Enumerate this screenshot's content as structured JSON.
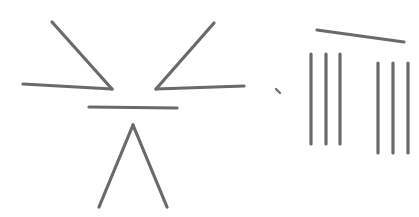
{
  "diagram": {
    "type": "matchstick-puzzle",
    "stick_color": "#6a6a6a",
    "stick_width": 3.2,
    "background": "#ffffff",
    "groups": [
      {
        "name": "figure-left",
        "sticks": [
          {
            "name": "left-upper-diagonal",
            "x1": 52,
            "y1": 22,
            "x2": 112,
            "y2": 89
          },
          {
            "name": "left-lower-arm",
            "x1": 23,
            "y1": 84,
            "x2": 112,
            "y2": 89
          },
          {
            "name": "right-upper-diagonal",
            "x1": 214,
            "y1": 23,
            "x2": 156,
            "y2": 89
          },
          {
            "name": "right-lower-arm",
            "x1": 156,
            "y1": 89,
            "x2": 244,
            "y2": 86
          },
          {
            "name": "middle-bar",
            "x1": 89,
            "y1": 107,
            "x2": 177,
            "y2": 108
          },
          {
            "name": "lambda-left-leg",
            "x1": 133,
            "y1": 125,
            "x2": 99,
            "y2": 207
          },
          {
            "name": "lambda-right-leg",
            "x1": 133,
            "y1": 125,
            "x2": 167,
            "y2": 207
          }
        ]
      },
      {
        "name": "figure-right",
        "sticks": [
          {
            "name": "top-slanted-bar",
            "x1": 317,
            "y1": 30,
            "x2": 404,
            "y2": 42
          },
          {
            "name": "left-vertical-1",
            "x1": 311,
            "y1": 54,
            "x2": 311,
            "y2": 144
          },
          {
            "name": "left-vertical-2",
            "x1": 326,
            "y1": 54,
            "x2": 326,
            "y2": 144
          },
          {
            "name": "left-vertical-3",
            "x1": 340,
            "y1": 54,
            "x2": 340,
            "y2": 144
          },
          {
            "name": "right-vertical-1",
            "x1": 378,
            "y1": 63,
            "x2": 378,
            "y2": 153
          },
          {
            "name": "right-vertical-2",
            "x1": 393,
            "y1": 63,
            "x2": 393,
            "y2": 153
          },
          {
            "name": "right-vertical-3",
            "x1": 408,
            "y1": 63,
            "x2": 408,
            "y2": 153
          }
        ]
      }
    ],
    "marks": [
      {
        "name": "small-tick-mark",
        "x1": 276,
        "y1": 89,
        "x2": 280,
        "y2": 93
      }
    ]
  }
}
